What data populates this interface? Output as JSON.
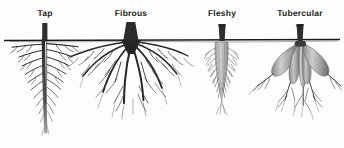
{
  "figure": {
    "background_color": "#fdfdfd",
    "soil_line": {
      "name": "soil-surface-line",
      "color": "#1a1a1a",
      "y": 40
    },
    "ink_color": "#2b2b2b",
    "tuber_color_light": "#c9c9c9",
    "tuber_color_dark": "#6a6a6a",
    "fleshy_color": "#b9b9b9",
    "labels": [
      {
        "text": "Tap",
        "x": 45,
        "y": 8
      },
      {
        "text": "Fibrous",
        "x": 131,
        "y": 8
      },
      {
        "text": "Fleshy",
        "x": 222,
        "y": 8
      },
      {
        "text": "Tubercular",
        "x": 300,
        "y": 8
      }
    ],
    "specimens": [
      {
        "name": "tap-root",
        "label": "Tap",
        "center_x": 45,
        "description": "Single thick vertical taproot with many fine lateral branches tapering downward"
      },
      {
        "name": "fibrous-root",
        "label": "Fibrous",
        "center_x": 131,
        "description": "Dense cluster of many similar-sized roots radiating outward and downward from the stem base"
      },
      {
        "name": "fleshy-root",
        "label": "Fleshy",
        "center_x": 222,
        "description": "Single swollen tapering carrot-like storage root with fine root hairs"
      },
      {
        "name": "tubercular-root",
        "label": "Tubercular",
        "center_x": 300,
        "description": "Cluster of several swollen tuberous lobes with thin roots extending from their tips"
      }
    ]
  }
}
